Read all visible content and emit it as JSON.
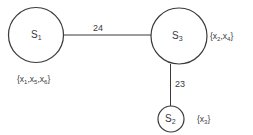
{
  "diagram": {
    "type": "graph",
    "nodes": [
      {
        "id": "S1",
        "letter": "S",
        "sub": "1",
        "cx": 36,
        "cy": 35,
        "r": 28,
        "set": {
          "open": "{",
          "close": "}",
          "items": [
            {
              "v": "x",
              "s": "1"
            },
            {
              "v": "x",
              "s": "5"
            },
            {
              "v": "x",
              "s": "6"
            }
          ]
        }
      },
      {
        "id": "S3",
        "letter": "S",
        "sub": "3",
        "cx": 179,
        "cy": 36,
        "r": 28,
        "set": {
          "open": "{",
          "close": "}",
          "items": [
            {
              "v": "x",
              "s": "2"
            },
            {
              "v": "x",
              "s": "4"
            }
          ]
        }
      },
      {
        "id": "S2",
        "letter": "S",
        "sub": "2",
        "cx": 171,
        "cy": 119,
        "r": 13,
        "set": {
          "open": "{",
          "close": "}",
          "items": [
            {
              "v": "x",
              "s": "3"
            }
          ]
        }
      }
    ],
    "edges": [
      {
        "from": "S1",
        "to": "S3",
        "weight": "24"
      },
      {
        "from": "S3",
        "to": "S2",
        "weight": "23"
      }
    ],
    "colors": {
      "stroke": "#3a3a3a",
      "background": "#ffffff"
    }
  }
}
